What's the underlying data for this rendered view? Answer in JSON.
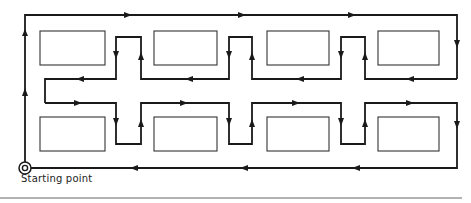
{
  "diagram": {
    "start_label": "Starting point",
    "colors": {
      "path": "#1a1a1a",
      "box": "#333333",
      "rule": "#555555",
      "background": "#ffffff"
    },
    "boxes": [
      {
        "row": "upper",
        "x": 40,
        "y": 31,
        "w": 65,
        "h": 34
      },
      {
        "row": "upper",
        "x": 154,
        "y": 31,
        "w": 63,
        "h": 34
      },
      {
        "row": "upper",
        "x": 267,
        "y": 31,
        "w": 62,
        "h": 34
      },
      {
        "row": "upper",
        "x": 378,
        "y": 31,
        "w": 61,
        "h": 34
      },
      {
        "row": "lower",
        "x": 40,
        "y": 117,
        "w": 65,
        "h": 34
      },
      {
        "row": "lower",
        "x": 154,
        "y": 117,
        "w": 63,
        "h": 34
      },
      {
        "row": "lower",
        "x": 267,
        "y": 117,
        "w": 62,
        "h": 34
      },
      {
        "row": "lower",
        "x": 378,
        "y": 117,
        "w": 61,
        "h": 34
      }
    ],
    "start_point": {
      "x": 25,
      "y": 168
    }
  }
}
